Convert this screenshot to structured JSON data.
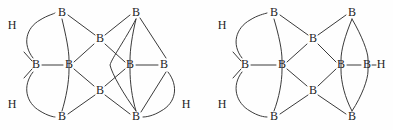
{
  "figure": {
    "background_color": "#fefefe",
    "stroke_color": "#3a3a3a",
    "label_color": "#1d1d1d"
  },
  "structures": [
    {
      "id": "left-structure",
      "name": "borane-cage-left",
      "atoms": [
        {
          "id": "L1",
          "label": "B",
          "x": 62,
          "y": 13
        },
        {
          "id": "L2",
          "label": "B",
          "x": 136,
          "y": 13
        },
        {
          "id": "L3",
          "label": "B",
          "x": 100,
          "y": 39
        },
        {
          "id": "L4",
          "label": "B",
          "x": 36,
          "y": 65
        },
        {
          "id": "L5",
          "label": "B",
          "x": 69,
          "y": 65
        },
        {
          "id": "L6",
          "label": "B",
          "x": 130,
          "y": 65
        },
        {
          "id": "L7",
          "label": "B",
          "x": 164,
          "y": 65
        },
        {
          "id": "L8",
          "label": "B",
          "x": 100,
          "y": 91
        },
        {
          "id": "L9",
          "label": "B",
          "x": 62,
          "y": 117
        },
        {
          "id": "L10",
          "label": "B",
          "x": 136,
          "y": 117
        },
        {
          "id": "LH1",
          "label": "H",
          "x": 12,
          "y": 26
        },
        {
          "id": "LH2",
          "label": "H",
          "x": 12,
          "y": 105
        },
        {
          "id": "LH3",
          "label": "H",
          "x": 186,
          "y": 105
        }
      ]
    },
    {
      "id": "right-structure",
      "name": "borane-cage-right",
      "atoms": [
        {
          "id": "R1",
          "label": "B",
          "x": 274,
          "y": 13
        },
        {
          "id": "R2",
          "label": "B",
          "x": 352,
          "y": 13
        },
        {
          "id": "R3",
          "label": "B",
          "x": 313,
          "y": 39
        },
        {
          "id": "R4",
          "label": "B",
          "x": 245,
          "y": 65
        },
        {
          "id": "R5",
          "label": "B",
          "x": 282,
          "y": 65
        },
        {
          "id": "R6",
          "label": "B",
          "x": 341,
          "y": 65
        },
        {
          "id": "R7",
          "label": "B",
          "x": 367,
          "y": 65
        },
        {
          "id": "R8",
          "label": "B",
          "x": 313,
          "y": 91
        },
        {
          "id": "R9",
          "label": "B",
          "x": 274,
          "y": 117
        },
        {
          "id": "R10",
          "label": "B",
          "x": 352,
          "y": 117
        },
        {
          "id": "RH1",
          "label": "H",
          "x": 222,
          "y": 26
        },
        {
          "id": "RH2",
          "label": "H",
          "x": 222,
          "y": 105
        },
        {
          "id": "RH3",
          "label": "H",
          "x": 381,
          "y": 65
        }
      ]
    }
  ]
}
